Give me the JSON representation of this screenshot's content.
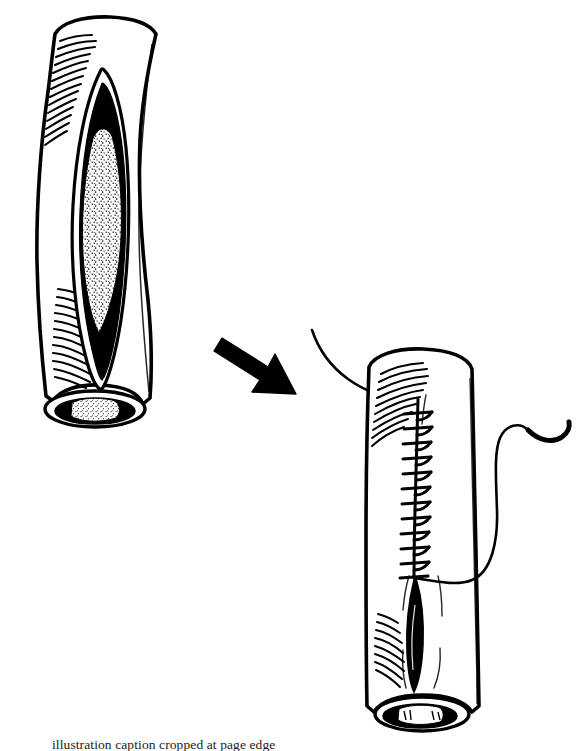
{
  "figure": {
    "domain": "medical-surgical-line-illustration",
    "background_color": "#ffffff",
    "ink_color": "#000000",
    "caption_partial_text": "illustration caption cropped at page edge",
    "panels": [
      {
        "id": "panel-left",
        "name": "open-incision-panel",
        "label": "Tubular structure with open longitudinal incision exposing stippled graft material",
        "position": {
          "x": 30,
          "y": 14,
          "width": 160,
          "height": 430
        },
        "elements": [
          "tube-outline",
          "hatch-shading-upper-left",
          "hatch-shading-lower-left",
          "incision-lips",
          "incision-dark-cavity",
          "stippled-graft-fill",
          "cut-end-ellipse",
          "cut-end-lumen"
        ]
      },
      {
        "id": "panel-arrow",
        "name": "transition-arrow",
        "label": "Solid black arrow pointing down and to the right indicating the next surgical step",
        "position": {
          "x": 212,
          "y": 330,
          "width": 100,
          "height": 65
        },
        "direction": "down-right"
      },
      {
        "id": "panel-right",
        "name": "sutured-closure-panel",
        "label": "Same tubular structure after closure with a continuous running suture; needle and thread still attached",
        "position": {
          "x": 350,
          "y": 330,
          "width": 180,
          "height": 410
        },
        "elements": [
          "tube-outline",
          "hatch-shading-upper",
          "hatch-shading-lower-left",
          "running-suture-line",
          "suture-cross-stitches",
          "residual-open-slit",
          "suture-thread-incoming",
          "suture-thread-trailing",
          "curved-needle",
          "cut-end-ellipse",
          "cut-end-lumen"
        ]
      }
    ],
    "annotations": {
      "stitch_count": 12,
      "graft_texture": "stipple",
      "line_style": "pen-and-ink hatching"
    }
  }
}
